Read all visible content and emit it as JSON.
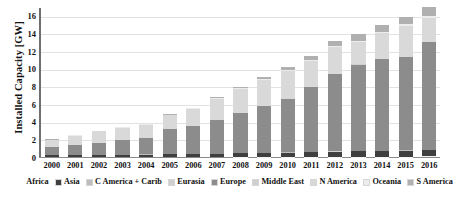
{
  "chart_data": {
    "type": "bar",
    "stacked": true,
    "title": "",
    "xlabel": "",
    "ylabel": "Installed Capacity [GW]",
    "ylim": [
      0,
      17
    ],
    "yticks": [
      0,
      2,
      4,
      6,
      8,
      10,
      12,
      14,
      16
    ],
    "ytick_labels": [
      "0",
      "2",
      "4",
      "6",
      "8",
      "10",
      "12",
      "14",
      "16"
    ],
    "grid": true,
    "legend_position": "bottom",
    "categories": [
      "2000",
      "2001",
      "2002",
      "2003",
      "2004",
      "2005",
      "2006",
      "2007",
      "2008",
      "2009",
      "2010",
      "2011",
      "2012",
      "2013",
      "2014",
      "2015",
      "2016"
    ],
    "series": [
      {
        "name": "Africa",
        "color": "#f2f2f2",
        "values": [
          0.0,
          0.0,
          0.0,
          0.0,
          0.0,
          0.0,
          0.0,
          0.0,
          0.01,
          0.01,
          0.01,
          0.02,
          0.02,
          0.03,
          0.04,
          0.05,
          0.06
        ]
      },
      {
        "name": "Asia",
        "color": "#3f3f3f",
        "values": [
          0.18,
          0.2,
          0.22,
          0.24,
          0.27,
          0.3,
          0.33,
          0.36,
          0.4,
          0.44,
          0.48,
          0.52,
          0.56,
          0.6,
          0.64,
          0.68,
          0.72
        ]
      },
      {
        "name": "C America + Carib",
        "color": "#bdbdbd",
        "values": [
          0.01,
          0.01,
          0.01,
          0.01,
          0.02,
          0.02,
          0.02,
          0.02,
          0.02,
          0.02,
          0.03,
          0.03,
          0.03,
          0.03,
          0.03,
          0.04,
          0.04
        ]
      },
      {
        "name": "Eurasia",
        "color": "#d0d0d0",
        "values": [
          0.0,
          0.0,
          0.0,
          0.0,
          0.0,
          0.0,
          0.0,
          0.0,
          0.01,
          0.01,
          0.01,
          0.01,
          0.02,
          0.02,
          0.02,
          0.03,
          0.03
        ]
      },
      {
        "name": "Europe",
        "color": "#8c8c8c",
        "values": [
          0.93,
          1.13,
          1.38,
          1.66,
          1.84,
          2.9,
          3.15,
          3.8,
          4.5,
          5.3,
          6.0,
          7.35,
          8.8,
          9.8,
          10.4,
          10.55,
          12.2
        ]
      },
      {
        "name": "Middle East",
        "color": "#cfcfcf",
        "values": [
          0.0,
          0.0,
          0.0,
          0.0,
          0.0,
          0.0,
          0.0,
          0.01,
          0.01,
          0.01,
          0.01,
          0.02,
          0.02,
          0.02,
          0.03,
          0.03,
          0.04
        ]
      },
      {
        "name": "N America",
        "color": "#d9d9d9",
        "values": [
          0.8,
          1.08,
          1.3,
          1.4,
          1.55,
          1.55,
          1.95,
          2.4,
          2.75,
          2.95,
          3.25,
          2.95,
          3.05,
          2.55,
          2.9,
          3.45,
          2.7
        ]
      },
      {
        "name": "Oceania",
        "color": "#ececec",
        "values": [
          0.03,
          0.03,
          0.04,
          0.04,
          0.05,
          0.05,
          0.06,
          0.07,
          0.08,
          0.09,
          0.1,
          0.12,
          0.14,
          0.16,
          0.18,
          0.2,
          0.22
        ]
      },
      {
        "name": "S America",
        "color": "#b0b0b0",
        "values": [
          0.05,
          0.05,
          0.05,
          0.05,
          0.07,
          0.08,
          0.09,
          0.14,
          0.2,
          0.27,
          0.31,
          0.44,
          0.56,
          0.69,
          0.79,
          0.87,
          0.99
        ]
      }
    ],
    "totals": [
      2.0,
      2.5,
      3.0,
      3.4,
      3.8,
      4.9,
      5.6,
      6.8,
      7.98,
      9.1,
      10.2,
      11.45,
      13.2,
      13.9,
      14.99,
      15.9,
      16.99
    ]
  },
  "axis": {
    "y_title": "Installed Capacity [GW]"
  }
}
